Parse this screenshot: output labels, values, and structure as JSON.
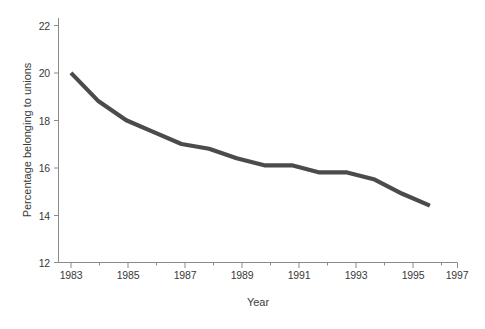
{
  "chart_data": {
    "type": "line",
    "title": "",
    "xlabel": "Year",
    "ylabel": "Percentage belonging to unions",
    "xlim": [
      1983,
      1997
    ],
    "ylim": [
      12,
      22
    ],
    "grid": false,
    "legend": null,
    "x_ticks_major": [
      "1983",
      "1985",
      "1987",
      "1989",
      "1991",
      "1993",
      "1995",
      "1997"
    ],
    "x_ticks_minor": [
      "1984",
      "1986",
      "1988",
      "1990",
      "1992",
      "1994",
      "1996"
    ],
    "y_ticks": [
      "12",
      "14",
      "16",
      "18",
      "20",
      "22"
    ],
    "line_color": "#4b4b4b",
    "x": [
      1983,
      1984,
      1985,
      1986,
      1987,
      1988,
      1989,
      1990,
      1991,
      1992,
      1993,
      1994,
      1995,
      1996
    ],
    "values": [
      20.0,
      18.8,
      18.0,
      17.5,
      17.0,
      16.8,
      16.4,
      16.1,
      16.1,
      15.8,
      15.8,
      15.5,
      14.9,
      14.4
    ],
    "series": [
      {
        "name": "Percentage belonging to unions",
        "values": [
          20.0,
          18.8,
          18.0,
          17.5,
          17.0,
          16.8,
          16.4,
          16.1,
          16.1,
          15.8,
          15.8,
          15.5,
          14.9,
          14.4
        ]
      }
    ]
  },
  "axes": {
    "y_title": "Percentage belonging to unions",
    "x_title": "Year",
    "y_tick_labels": [
      "22",
      "20",
      "18",
      "16",
      "14",
      "12"
    ],
    "x_tick_labels": [
      "1983",
      "1985",
      "1987",
      "1989",
      "1991",
      "1993",
      "1995",
      "1997"
    ]
  }
}
